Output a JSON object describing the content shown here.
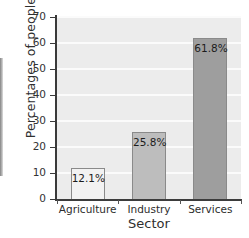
{
  "chart_data": {
    "type": "bar",
    "title": "",
    "categories": [
      "Agriculture",
      "Industry",
      "Services"
    ],
    "values": [
      12.1,
      25.8,
      61.8
    ],
    "data_labels": [
      "12.1%",
      "25.8%",
      "61.8%"
    ],
    "xlabel": "Sector",
    "ylabel": "Percentages of people",
    "ylim": [
      0,
      70
    ],
    "yticks": [
      0,
      10,
      20,
      30,
      40,
      50,
      60,
      70
    ],
    "ytick_labels": [
      "0",
      "10",
      "20",
      "30",
      "40",
      "50",
      "60",
      "70"
    ],
    "grid": "horizontal",
    "legend": "none",
    "plot_background": "#ececec",
    "gridline_color": "#fbfbfb",
    "bar_colors": [
      "#f2f2f2",
      "#bdbdbd",
      "#9e9e9e"
    ],
    "bar_edge_color": "#8a8a8a"
  }
}
